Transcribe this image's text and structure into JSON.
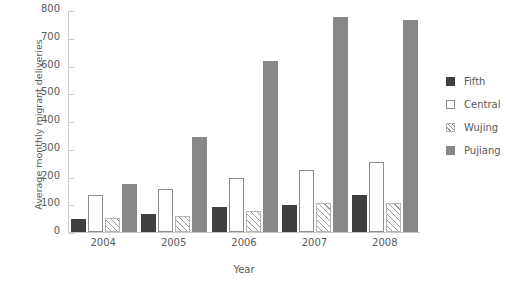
{
  "chart_data": {
    "type": "bar",
    "title": "",
    "xlabel": "Year",
    "ylabel": "Average monthly migrant deliveries",
    "categories": [
      "2004",
      "2005",
      "2006",
      "2007",
      "2008"
    ],
    "ylim": [
      0,
      800
    ],
    "yticks": [
      0,
      100,
      200,
      300,
      400,
      500,
      600,
      700,
      800
    ],
    "grid": false,
    "legend_position": "right",
    "series": [
      {
        "name": "Fifth",
        "color": "#3f3f3f",
        "fill": "solid",
        "values": [
          47,
          65,
          90,
          98,
          132
        ]
      },
      {
        "name": "Central",
        "color": "#ffffff",
        "fill": "empty",
        "values": [
          133,
          155,
          193,
          225,
          253
        ]
      },
      {
        "name": "Wujing",
        "color": "#9a9a9a",
        "fill": "hatch",
        "values": [
          50,
          57,
          75,
          103,
          103
        ]
      },
      {
        "name": "Pujiang",
        "color": "#878787",
        "fill": "solid",
        "values": [
          173,
          342,
          617,
          775,
          765
        ]
      }
    ]
  }
}
